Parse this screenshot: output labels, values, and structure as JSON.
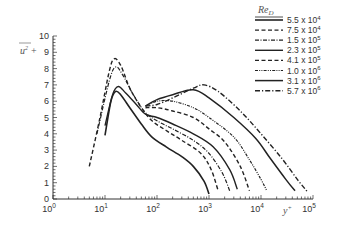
{
  "chart_data": {
    "type": "line",
    "title": "",
    "xlabel": "y+",
    "ylabel": "u'^2 +",
    "xscale": "log",
    "xlim": [
      1,
      100000
    ],
    "ylim": [
      0,
      10
    ],
    "x_ticks": [
      "10^0",
      "10^1",
      "10^2",
      "10^3",
      "10^4",
      "10^5"
    ],
    "y_ticks": [
      "0",
      "1",
      "2",
      "3",
      "4",
      "5",
      "6",
      "7",
      "8",
      "9",
      "10"
    ],
    "grid": false,
    "legend_title": "Re_D",
    "legend_position": "upper right",
    "series": [
      {
        "name": "5.5 x 10^4",
        "style": "solid",
        "width": 1.6,
        "points": [
          [
            10,
            3.9
          ],
          [
            13,
            6.0
          ],
          [
            16,
            6.6
          ],
          [
            20,
            6.4
          ],
          [
            30,
            5.6
          ],
          [
            50,
            4.6
          ],
          [
            80,
            3.8
          ],
          [
            150,
            3.2
          ],
          [
            300,
            2.6
          ],
          [
            500,
            2.0
          ],
          [
            800,
            1.1
          ],
          [
            1000,
            0.3
          ]
        ]
      },
      {
        "name": "7.5 x 10^4",
        "style": "dash",
        "width": 1.4,
        "points": [
          [
            5,
            2.0
          ],
          [
            8,
            5.0
          ],
          [
            12,
            7.8
          ],
          [
            15,
            8.6
          ],
          [
            20,
            8.2
          ],
          [
            30,
            6.8
          ],
          [
            50,
            5.6
          ],
          [
            80,
            4.8
          ],
          [
            150,
            4.2
          ],
          [
            300,
            3.6
          ],
          [
            700,
            2.8
          ],
          [
            1100,
            1.8
          ],
          [
            1500,
            0.5
          ]
        ]
      },
      {
        "name": "1.5 x 10^5",
        "style": "dashdot",
        "width": 1.2,
        "points": [
          [
            7,
            4.0
          ],
          [
            12,
            7.2
          ],
          [
            16,
            8.1
          ],
          [
            22,
            7.6
          ],
          [
            35,
            6.4
          ],
          [
            60,
            5.3
          ],
          [
            100,
            4.8
          ],
          [
            200,
            4.3
          ],
          [
            500,
            3.6
          ],
          [
            1000,
            2.8
          ],
          [
            1800,
            1.6
          ],
          [
            2500,
            0.5
          ]
        ]
      },
      {
        "name": "2.3 x 10^5",
        "style": "solid",
        "width": 1.4,
        "points": [
          [
            10,
            4.5
          ],
          [
            14,
            6.4
          ],
          [
            18,
            6.9
          ],
          [
            25,
            6.5
          ],
          [
            40,
            5.8
          ],
          [
            60,
            5.2
          ],
          [
            100,
            5.0
          ],
          [
            200,
            4.6
          ],
          [
            500,
            4.0
          ],
          [
            1200,
            3.2
          ],
          [
            2500,
            1.8
          ],
          [
            3500,
            0.6
          ]
        ]
      },
      {
        "name": "4.1 x 10^5",
        "style": "dash",
        "width": 1.4,
        "points": [
          [
            60,
            5.6
          ],
          [
            100,
            5.6
          ],
          [
            200,
            5.4
          ],
          [
            500,
            5.0
          ],
          [
            1000,
            4.3
          ],
          [
            2000,
            3.5
          ],
          [
            4000,
            2.0
          ],
          [
            6000,
            0.5
          ]
        ]
      },
      {
        "name": "1.0 x 10^6",
        "style": "dashdotdot",
        "width": 1.2,
        "points": [
          [
            60,
            5.7
          ],
          [
            100,
            6.0
          ],
          [
            200,
            6.0
          ],
          [
            500,
            5.6
          ],
          [
            1000,
            5.0
          ],
          [
            3000,
            3.8
          ],
          [
            6000,
            2.4
          ],
          [
            10000,
            1.2
          ],
          [
            13000,
            0.5
          ]
        ]
      },
      {
        "name": "3.1 x 10^6",
        "style": "solid",
        "width": 1.5,
        "points": [
          [
            60,
            5.7
          ],
          [
            100,
            6.1
          ],
          [
            200,
            6.4
          ],
          [
            500,
            6.7
          ],
          [
            1000,
            6.2
          ],
          [
            3000,
            5.0
          ],
          [
            8000,
            3.7
          ],
          [
            15000,
            2.5
          ],
          [
            30000,
            1.2
          ],
          [
            45000,
            0.5
          ]
        ]
      },
      {
        "name": "5.7 x 10^6",
        "style": "dashdotlong",
        "width": 1.4,
        "points": [
          [
            60,
            5.7
          ],
          [
            100,
            5.8
          ],
          [
            200,
            6.2
          ],
          [
            500,
            6.8
          ],
          [
            800,
            7.0
          ],
          [
            1500,
            6.6
          ],
          [
            4000,
            5.4
          ],
          [
            10000,
            4.0
          ],
          [
            25000,
            2.5
          ],
          [
            50000,
            1.2
          ],
          [
            80000,
            0.4
          ]
        ]
      }
    ]
  },
  "legend": {
    "title": "Re_D",
    "entries": [
      {
        "label": "5.5 x 10",
        "exp": "4"
      },
      {
        "label": "7.5 x 10",
        "exp": "4"
      },
      {
        "label": "1.5 x 10",
        "exp": "5"
      },
      {
        "label": "2.3 x 10",
        "exp": "5"
      },
      {
        "label": "4.1 x 10",
        "exp": "5"
      },
      {
        "label": "1.0 x 10",
        "exp": "6"
      },
      {
        "label": "3.1 x 10",
        "exp": "6"
      },
      {
        "label": "5.7 x 10",
        "exp": "6"
      }
    ]
  },
  "axes": {
    "ylabel_main": "u",
    "ylabel_sup": "2",
    "ylabel_plus": "+",
    "xlabel_main": "y",
    "xlabel_sup": "+"
  }
}
